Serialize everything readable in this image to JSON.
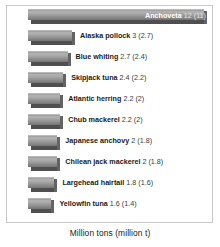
{
  "chart_data": {
    "type": "bar",
    "orientation": "horizontal",
    "title": "",
    "subtitle": "",
    "xlabel": "Million tons (million t)",
    "ylabel": "",
    "grid": false,
    "legend": "none",
    "xlim": [
      0,
      12
    ],
    "categories": [
      "Anchoveta",
      "Alaska pollock",
      "Blue whiting",
      "Skipjack tuna",
      "Atlantic herring",
      "Chub mackerel",
      "Japanese anchovy",
      "Chilean jack mackerel",
      "Largehead hairtail",
      "Yellowfin tuna"
    ],
    "values": [
      12,
      3,
      2.7,
      2.4,
      2.2,
      2.2,
      2,
      2,
      1.8,
      1.6
    ],
    "secondary_values": [
      11,
      2.7,
      2.4,
      2.2,
      2,
      2,
      1.8,
      1.8,
      1.6,
      1.4
    ],
    "bars": [
      {
        "name": "Anchoveta",
        "value": "12",
        "secondary": "(11)",
        "label_position": "inside"
      },
      {
        "name": "Alaska pollock",
        "value": "3",
        "secondary": "(2.7)",
        "label_position": "outside"
      },
      {
        "name": "Blue whiting",
        "value": "2.7",
        "secondary": "(2.4)",
        "label_position": "outside"
      },
      {
        "name": "Skipjack tuna",
        "value": "2.4",
        "secondary": "(2.2)",
        "label_position": "outside"
      },
      {
        "name": "Atlantic herring",
        "value": "2.2",
        "secondary": "(2)",
        "label_position": "outside"
      },
      {
        "name": "Chub mackerel",
        "value": "2.2",
        "secondary": "(2)",
        "label_position": "outside"
      },
      {
        "name": "Japanese anchovy",
        "value": "2",
        "secondary": "(1.8)",
        "label_position": "outside"
      },
      {
        "name": "Chilean jack mackerel",
        "value": "2",
        "secondary": "(1.8)",
        "label_position": "outside"
      },
      {
        "name": "Largehead hairtail",
        "value": "1.8",
        "secondary": "(1.6)",
        "label_position": "outside"
      },
      {
        "name": "Yellowfin tuna",
        "value": "1.6",
        "secondary": "(1.4)",
        "label_position": "outside"
      }
    ]
  },
  "axis": {
    "caption": "Million tons (million t)"
  },
  "colors": {
    "bar_light": "#b4b4b4",
    "bar_mid": "#a2a2a2",
    "bar_dark": "#757575",
    "bar_shadow": "#4f4f4f",
    "frame_border": "#c8c8c8",
    "background": "#ffffff",
    "label_text": "#1a1a1a",
    "inside_label_text": "#ffffff"
  }
}
